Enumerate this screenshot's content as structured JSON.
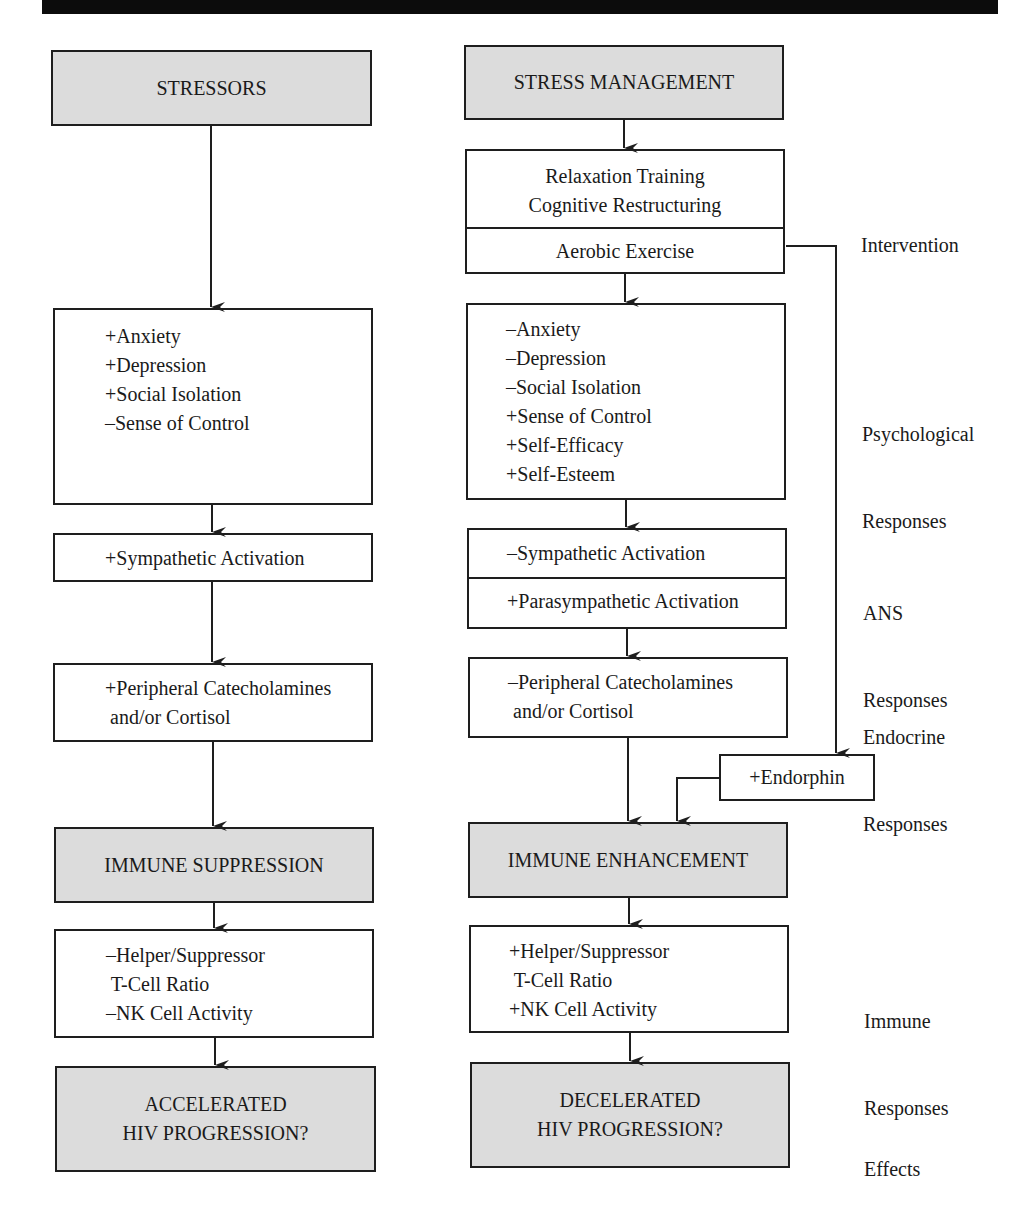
{
  "colors": {
    "box_border": "#1e1e1e",
    "gray_fill": "#dcdcdc",
    "top_bar": "#0c0c0c",
    "text": "#1a1a1a"
  },
  "left_column": {
    "header": "STRESSORS",
    "psychological": [
      "+Anxiety",
      "+Depression",
      "+Social Isolation",
      "–Sense of Control"
    ],
    "ans": "+Sympathetic Activation",
    "endocrine": [
      "+Peripheral Catecholamines",
      " and/or Cortisol"
    ],
    "immune_header": "IMMUNE SUPPRESSION",
    "immune": [
      "–Helper/Suppressor",
      " T-Cell Ratio",
      "–NK Cell Activity"
    ],
    "effect": [
      "ACCELERATED",
      "HIV PROGRESSION?"
    ]
  },
  "right_column": {
    "header": "STRESS MANAGEMENT",
    "intervention": [
      "Relaxation Training",
      "Cognitive Restructuring"
    ],
    "aerobic": "Aerobic Exercise",
    "psychological": [
      "–Anxiety",
      "–Depression",
      "–Social Isolation",
      "+Sense of Control",
      "+Self-Efficacy",
      "+Self-Esteem"
    ],
    "ans_sympathetic": "–Sympathetic Activation",
    "ans_parasympathetic": "+Parasympathetic Activation",
    "endocrine": [
      "–Peripheral Catecholamines",
      " and/or Cortisol"
    ],
    "endorphin": "+Endorphin",
    "immune_header": "IMMUNE ENHANCEMENT",
    "immune": [
      "+Helper/Suppressor",
      " T-Cell Ratio",
      "+NK Cell Activity"
    ],
    "effect": [
      "DECELERATED",
      "HIV PROGRESSION?"
    ]
  },
  "stage_labels": {
    "intervention": "Intervention",
    "psychological": [
      "Psychological",
      "Responses"
    ],
    "ans": [
      "ANS",
      "Responses"
    ],
    "endocrine": [
      "Endocrine",
      "Responses"
    ],
    "immune": [
      "Immune",
      "Responses"
    ],
    "effects": "Effects"
  }
}
